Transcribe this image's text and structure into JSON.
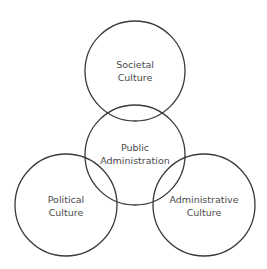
{
  "diagram": {
    "type": "venn",
    "colors": {
      "stroke": "#3a3a3a",
      "text": "#4a4a4a",
      "background": "#ffffff"
    },
    "circles": [
      {
        "id": "societal",
        "cx": 135,
        "cy": 71,
        "r": 50,
        "lines": [
          "Societal",
          "Culture"
        ]
      },
      {
        "id": "public-admin",
        "cx": 135,
        "cy": 155,
        "r": 50,
        "lines": [
          "Public",
          "Administration"
        ]
      },
      {
        "id": "political",
        "cx": 66,
        "cy": 205,
        "r": 51,
        "lines": [
          "Political",
          "Culture"
        ]
      },
      {
        "id": "administrative",
        "cx": 204,
        "cy": 205,
        "r": 51,
        "lines": [
          "Administrative",
          "Culture"
        ]
      }
    ]
  }
}
